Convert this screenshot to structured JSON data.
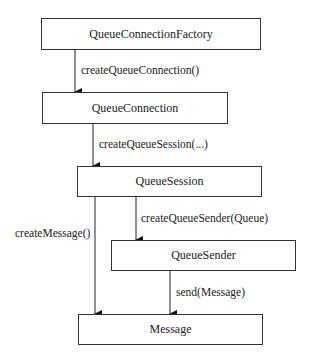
{
  "nodes": {
    "factory": "QueueConnectionFactory",
    "connection": "QueueConnection",
    "session": "QueueSession",
    "sender": "QueueSender",
    "message": "Message"
  },
  "edges": {
    "create_connection": "createQueueConnection()",
    "create_session": "createQueueSession(...)",
    "create_sender": "createQueueSender(Queue)",
    "create_message": "createMessage()",
    "send": "send(Message)"
  }
}
